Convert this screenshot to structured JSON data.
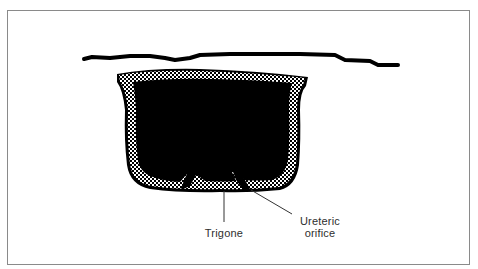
{
  "figure": {
    "type": "anatomical-diagram",
    "colors": {
      "frame": "#8a8a8a",
      "fill": "#000000",
      "stipple": "#ffffff",
      "label_text": "#2e2e2e"
    }
  },
  "labels": {
    "trigone": "Trigone",
    "ureteric_line1": "Ureteric",
    "ureteric_line2": "orifice"
  }
}
